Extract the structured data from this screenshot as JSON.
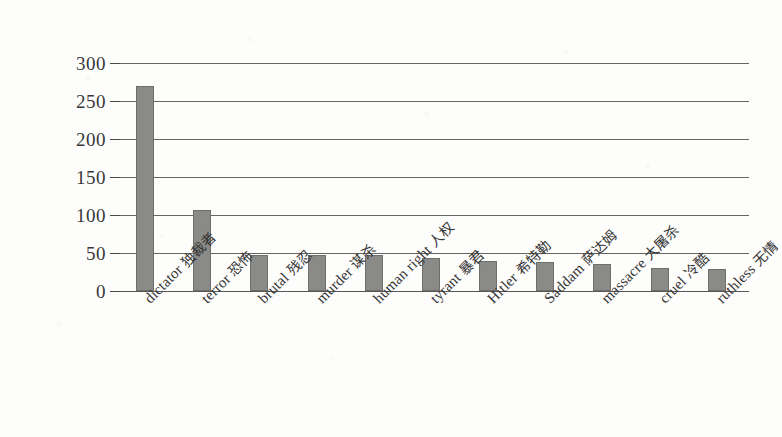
{
  "chart_data": {
    "type": "bar",
    "title": "",
    "subtitle": "",
    "xlabel": "",
    "ylabel": "",
    "ylim": [
      0,
      300
    ],
    "ytick_values": [
      300,
      250,
      200,
      150,
      100,
      50,
      0
    ],
    "ytick_labels": [
      "300",
      "250",
      "200",
      "150",
      "100",
      "50",
      "0"
    ],
    "grid": true,
    "grid_axis": "y",
    "legend": false,
    "legend_position": "none",
    "bar_color": "#8a8a88",
    "axis_color": "#4a4a48",
    "background_color": "#fdfdfc",
    "xtick_rotation": -45,
    "categories": [
      "dictator 独裁者",
      "terror 恐怖",
      "brutal 残忍",
      "murder 谋杀",
      "human right 人权",
      "tyrant 暴君",
      "Hitler 希特勒",
      "Saddam 萨达姆",
      "massacre 大屠杀",
      "cruel 冷酷",
      "ruthless 无情"
    ],
    "categories_en": [
      "dictator",
      "terror",
      "brutal",
      "murder",
      "human right",
      "tyrant",
      "Hitler",
      "Saddam",
      "massacre",
      "cruel",
      "ruthless"
    ],
    "categories_zh": [
      "独裁者",
      "恐怖",
      "残忍",
      "谋杀",
      "人权",
      "暴君",
      "希特勒",
      "萨达姆",
      "大屠杀",
      "冷酷",
      "无情"
    ],
    "values": [
      270,
      107,
      48,
      48,
      47,
      43,
      40,
      38,
      36,
      30,
      29
    ]
  }
}
